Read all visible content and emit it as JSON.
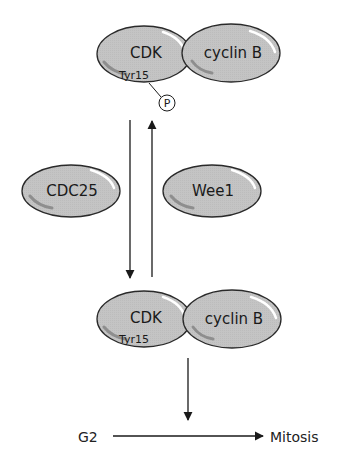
{
  "colors": {
    "protein_fill": "#c4c4c4",
    "protein_stroke": "#2a2a2a",
    "highlight": "#ffffff",
    "shadow": "#8e8e8e",
    "arrow": "#1a1a1a"
  },
  "top_complex": {
    "cdk_label": "CDK",
    "cyclin_label": "cyclin B",
    "site_label": "Tyr15",
    "phosphate_label": "P"
  },
  "regulators": {
    "activator": "CDC25",
    "inhibitor": "Wee1"
  },
  "bottom_complex": {
    "cdk_label": "CDK",
    "cyclin_label": "cyclin B",
    "site_label": "Tyr15"
  },
  "transition": {
    "from": "G2",
    "to": "Mitosis"
  }
}
